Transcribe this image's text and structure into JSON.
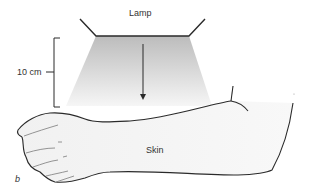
{
  "figure": {
    "lamp_label": "Lamp",
    "distance_label": "10 cm",
    "skin_label": "Skin",
    "panel_label": "b"
  },
  "colors": {
    "line": "#2a2a2a",
    "beam_top": "#bdbdbd",
    "beam_bottom": "#f4f4f4",
    "arm_fill": "#f3f3f3",
    "text": "#333333"
  }
}
